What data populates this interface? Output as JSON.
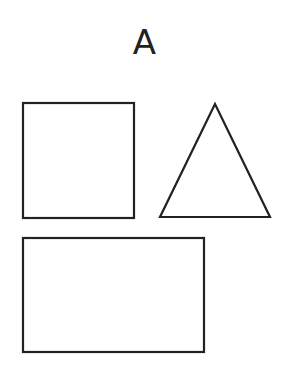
{
  "figure": {
    "label": "A",
    "stroke_color": "#222222",
    "shapes": [
      {
        "type": "square",
        "x": 23,
        "y": 103,
        "width": 111,
        "height": 115
      },
      {
        "type": "triangle",
        "points": "215,104 160,217 270,217"
      },
      {
        "type": "rectangle",
        "x": 23,
        "y": 238,
        "width": 181,
        "height": 114
      }
    ]
  }
}
